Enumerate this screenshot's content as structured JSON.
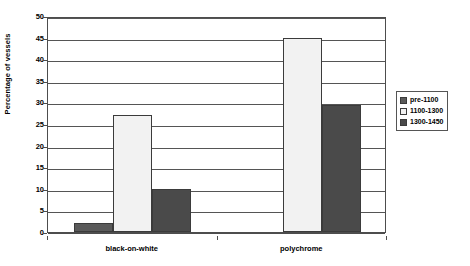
{
  "chart_data": {
    "type": "bar",
    "title": "",
    "xlabel": "",
    "ylabel": "Percentage of vessels",
    "categories": [
      "black-on-white",
      "polychrome"
    ],
    "series": [
      {
        "name": "pre-1100",
        "values": [
          2,
          0
        ],
        "color": "#5a5a5a"
      },
      {
        "name": "1100-1300",
        "values": [
          27,
          45
        ],
        "color": "#f2f2f2"
      },
      {
        "name": "1300-1450",
        "values": [
          10,
          29.5
        ],
        "color": "#4a4a4a"
      }
    ],
    "ylim": [
      0,
      50
    ],
    "yticks": [
      0,
      5,
      10,
      15,
      20,
      25,
      30,
      35,
      40,
      45,
      50
    ],
    "ytick_labels": [
      "0",
      "5",
      "10",
      "15",
      "20",
      "25",
      "30",
      "35",
      "40",
      "45",
      "50"
    ],
    "grid": true,
    "legend_position": "right"
  },
  "legend": {
    "entries": [
      {
        "label": "pre-1100",
        "swatch": "#5a5a5a"
      },
      {
        "label": "1100-1300",
        "swatch": "#f2f2f2"
      },
      {
        "label": "1300-1450",
        "swatch": "#4a4a4a"
      }
    ]
  },
  "colors": {
    "axis": "#4d4d4d",
    "grid": "#555555",
    "bar_border": "#3b3b3b",
    "background": "#ffffff",
    "text": "#000000"
  }
}
